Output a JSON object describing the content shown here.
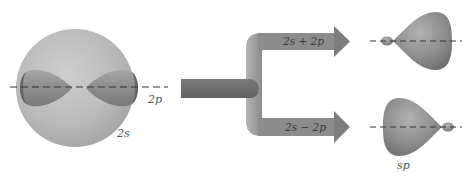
{
  "diagram": {
    "labels": {
      "p_orbital": "2p",
      "s_orbital": "2s",
      "sum_combination": "2s + 2p",
      "difference_combination": "2s − 2p",
      "hybrid": "sp"
    },
    "colors": {
      "background": "#ffffff",
      "s_sphere": "#b8b8b8",
      "p_lobe": "#8c8c8c",
      "stem_arrow": "#6e6e6e",
      "branch": "#a6a6a6",
      "hybrid_lobe": "#8a8a8a",
      "axis": "#333333",
      "label_text": "#555555"
    },
    "components": [
      {
        "id": "s-sphere",
        "description": "2s spherical orbital"
      },
      {
        "id": "p-orbital",
        "description": "2p dumbbell orbital along dashed axis"
      },
      {
        "id": "branching-arrow",
        "description": "arrow splitting into two combinations"
      },
      {
        "id": "sp-hybrid-top",
        "description": "sp hybrid, large lobe to right"
      },
      {
        "id": "sp-hybrid-bottom",
        "description": "sp hybrid, large lobe to left"
      }
    ]
  }
}
